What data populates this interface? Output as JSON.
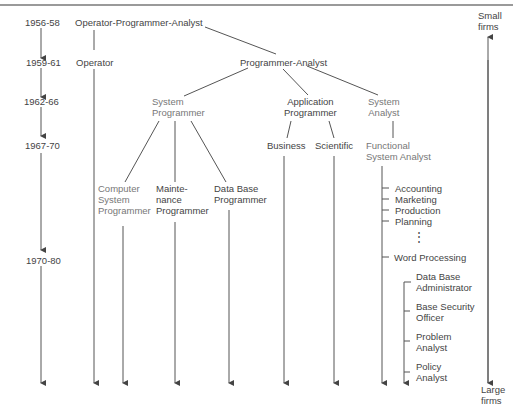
{
  "periods": [
    "1956-58",
    "1959-61",
    "1962-66",
    "1967-70",
    "1970-80"
  ],
  "scale": {
    "top": "Small\nfirms",
    "bottom": "Large\nfirms"
  },
  "nodes": {
    "opa": "Operator-Programmer-Analyst",
    "operator": "Operator",
    "pa": "Programmer-Analyst",
    "sysprog": "System\nProgrammer",
    "appprog": "Application\nProgrammer",
    "sysanalyst": "System\nAnalyst",
    "business": "Business",
    "scientific": "Scientific",
    "fsa": "Functional\nSystem Analyst",
    "csp": "Computer\nSystem\nProgrammer",
    "maint": "Mainte-\nnance\nProgrammer",
    "dbp": "Data Base\nProgrammer"
  },
  "functional_areas": [
    "Accounting",
    "Marketing",
    "Production",
    "Planning",
    "Word Processing"
  ],
  "ellipsis": "⋮",
  "specialists": [
    "Data Base\nAdministrator",
    "Base Security\nOfficer",
    "Problem\nAnalyst",
    "Policy\nAnalyst"
  ]
}
